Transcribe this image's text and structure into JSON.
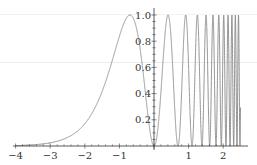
{
  "chart_data": {
    "type": "line",
    "title": "",
    "xlabel": "",
    "ylabel": "",
    "function": "sin^2(pi * e^x)",
    "xlim": [
      -4,
      2.5
    ],
    "ylim": [
      0,
      1.0
    ],
    "x_ticks": [
      "-4",
      "-3",
      "-2",
      "-1",
      "1",
      "2"
    ],
    "y_ticks": [
      "0.2",
      "0.4",
      "0.6",
      "0.8",
      "1.0"
    ],
    "grid": false,
    "legend": null,
    "series": [
      {
        "name": "f(x)",
        "color": "#888888"
      }
    ]
  }
}
